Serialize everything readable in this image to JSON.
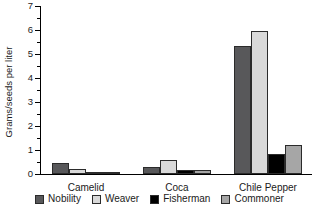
{
  "chart_data": {
    "type": "bar",
    "title": "",
    "xlabel": "",
    "ylabel": "Grams/seeds per liter",
    "ylim": [
      0,
      7
    ],
    "ytick_labels": [
      "0",
      "1",
      "2",
      "3",
      "4",
      "5",
      "6",
      "7"
    ],
    "ytick_values": [
      0,
      1,
      2,
      3,
      4,
      5,
      6,
      7
    ],
    "minor_ticks": [
      0.5,
      1.5,
      2.5,
      3.5,
      4.5,
      5.5,
      6.5
    ],
    "grid": false,
    "legend_position": "bottom",
    "categories": [
      "Camelid",
      "Coca",
      "Chile Pepper"
    ],
    "series": [
      {
        "name": "Nobility",
        "color": "#58585a",
        "values": [
          0.47,
          0.28,
          5.33
        ]
      },
      {
        "name": "Weaver",
        "color": "#d9d9d9",
        "values": [
          0.2,
          0.58,
          5.96
        ]
      },
      {
        "name": "Fisherman",
        "color": "#000000",
        "values": [
          0.07,
          0.15,
          0.84
        ]
      },
      {
        "name": "Commoner",
        "color": "#a6a6a6",
        "values": [
          0.08,
          0.18,
          1.22
        ]
      }
    ]
  },
  "axis": {
    "line_color": "#000000"
  }
}
